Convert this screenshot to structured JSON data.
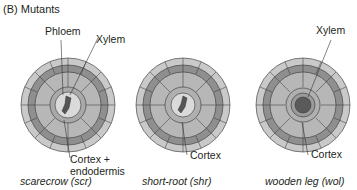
{
  "panel_title": "(B)  Mutants",
  "colors": {
    "epidermis_outer": "#c8c8c8",
    "epidermis_dark": "#8f8f8f",
    "cortex": "#b4b4b4",
    "endodermis": "#a6a6a6",
    "stele": "#d9d9d9",
    "xylem": "#555555",
    "outline": "#333333"
  },
  "diagrams": [
    {
      "id": "scr",
      "caption": "scarecrow (scr)",
      "labels": {
        "top1": "Phloem",
        "top2": "Xylem",
        "bottom1": "Cortex +",
        "bottom2": "endodermis"
      }
    },
    {
      "id": "shr",
      "caption": "short-root (shr)",
      "labels": {
        "bottom": "Cortex"
      }
    },
    {
      "id": "wol",
      "caption": "wooden leg (wol)",
      "labels": {
        "top": "Xylem",
        "bottom": "Cortex"
      }
    }
  ]
}
